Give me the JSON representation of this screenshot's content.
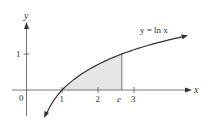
{
  "figure": {
    "function_label": "y = ln x",
    "x_axis_label": "x",
    "y_axis_label": "y",
    "origin_label": "0",
    "x_ticks": [
      {
        "label": "1",
        "value": 1
      },
      {
        "label": "2",
        "value": 2
      },
      {
        "label": "e",
        "value": 2.718
      },
      {
        "label": "3",
        "value": 3
      }
    ],
    "y_ticks": [
      {
        "label": "1",
        "value": 1
      }
    ],
    "shaded_region": {
      "from": 1,
      "to": 2.718,
      "description": "area under y = ln x from 1 to e"
    },
    "colors": {
      "curve": "#333333",
      "axes": "#555555",
      "shade": "#e6e6e6",
      "text": "#333333"
    }
  }
}
